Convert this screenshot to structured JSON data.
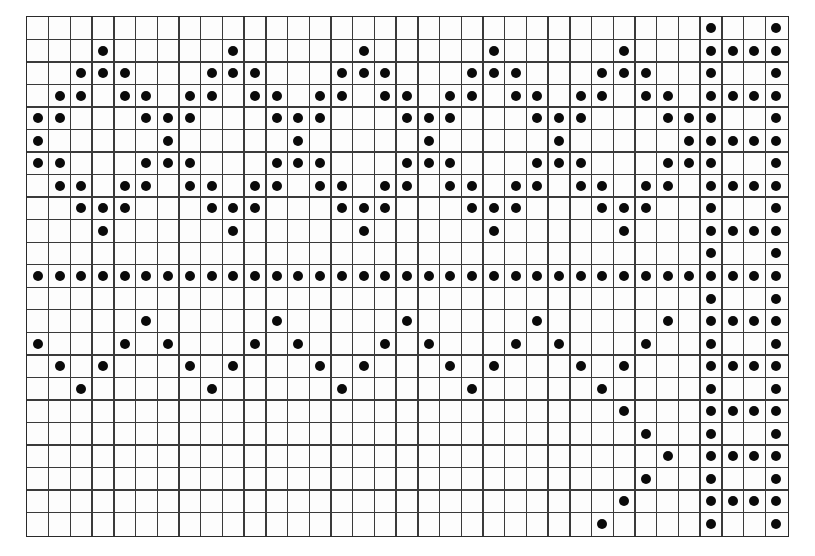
{
  "figure": {
    "type": "dot-grid-pattern",
    "grid": {
      "columns": 35,
      "rows": 23
    },
    "colors": {
      "background": "#ffffff",
      "grid_line": "#3a3a3a",
      "dot": "#0a0a0a"
    },
    "dots_by_column": [
      [
        4,
        5,
        6,
        11,
        14
      ],
      [
        3,
        4,
        6,
        7,
        11,
        15
      ],
      [
        2,
        3,
        7,
        8,
        11,
        16
      ],
      [
        1,
        2,
        8,
        9,
        11,
        15
      ],
      [
        2,
        3,
        7,
        8,
        11,
        14
      ],
      [
        3,
        4,
        6,
        7,
        11,
        13
      ],
      [
        4,
        5,
        6,
        11,
        14
      ],
      [
        3,
        4,
        6,
        7,
        11,
        15
      ],
      [
        2,
        3,
        7,
        8,
        11,
        16
      ],
      [
        1,
        2,
        8,
        9,
        11,
        15
      ],
      [
        2,
        3,
        7,
        8,
        11,
        14
      ],
      [
        3,
        4,
        6,
        7,
        11,
        13
      ],
      [
        4,
        5,
        6,
        11,
        14
      ],
      [
        3,
        4,
        6,
        7,
        11,
        15
      ],
      [
        2,
        3,
        7,
        8,
        11,
        16
      ],
      [
        1,
        2,
        8,
        9,
        11,
        15
      ],
      [
        2,
        3,
        7,
        8,
        11,
        14
      ],
      [
        3,
        4,
        6,
        7,
        11,
        13
      ],
      [
        4,
        5,
        6,
        11,
        14
      ],
      [
        3,
        4,
        6,
        7,
        11,
        15
      ],
      [
        2,
        3,
        7,
        8,
        11,
        16
      ],
      [
        1,
        2,
        8,
        9,
        11,
        15
      ],
      [
        2,
        3,
        7,
        8,
        11,
        14
      ],
      [
        3,
        4,
        6,
        7,
        11,
        13
      ],
      [
        4,
        5,
        6,
        11,
        14
      ],
      [
        3,
        4,
        6,
        7,
        11,
        15
      ],
      [
        2,
        3,
        7,
        8,
        11,
        16,
        22
      ],
      [
        1,
        2,
        8,
        9,
        11,
        15,
        17,
        21
      ],
      [
        2,
        3,
        7,
        8,
        11,
        14,
        18,
        20
      ],
      [
        3,
        4,
        6,
        7,
        11,
        13,
        19
      ],
      [
        4,
        5,
        6,
        11
      ],
      [
        0,
        1,
        2,
        3,
        4,
        5,
        6,
        7,
        8,
        9,
        10,
        11,
        12,
        13,
        14,
        15,
        16,
        17,
        18,
        19,
        20,
        21,
        22
      ],
      [
        1,
        3,
        5,
        7,
        9,
        11,
        13,
        15,
        17,
        19,
        21
      ],
      [
        1,
        3,
        5,
        7,
        9,
        11,
        13,
        15,
        17,
        19,
        21
      ],
      [
        0,
        1,
        2,
        3,
        4,
        5,
        6,
        7,
        8,
        9,
        10,
        11,
        12,
        13,
        14,
        15,
        16,
        17,
        18,
        19,
        20,
        21,
        22
      ]
    ]
  }
}
